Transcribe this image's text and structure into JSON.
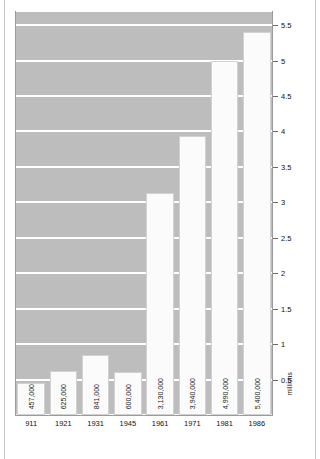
{
  "chart_data": {
    "type": "bar",
    "title": "",
    "subtitle": "",
    "xlabel": "",
    "ylabel": "millions",
    "categories": [
      "911",
      "1921",
      "1931",
      "1945",
      "1961",
      "1971",
      "1981",
      "1986"
    ],
    "values": [
      0.457,
      0.625,
      0.841,
      0.6,
      3.13,
      3.94,
      4.99,
      5.4
    ],
    "data_labels": [
      "457,000",
      "625,000",
      "841,000",
      "600,000",
      "3,130,000",
      "3,940,000",
      "4,990,000",
      "5,400,000"
    ],
    "ylim": [
      0,
      5.7
    ],
    "yticks": [
      0.5,
      1,
      1.5,
      2,
      2.5,
      3,
      3.5,
      4,
      4.5,
      5,
      5.5
    ],
    "ytick_labels": [
      "0.5",
      "1",
      "1.5",
      "2",
      "2.5",
      "3",
      "3.5",
      "4",
      "4.5",
      "5",
      "5.5"
    ],
    "grid": true,
    "grid_style": "banded",
    "legend": "none",
    "axis_position": "right",
    "colors": {
      "band": "#bdbdbd",
      "bar_fill": "#fbfbfb",
      "bar_border": "#d2d2d2",
      "axis": "#9a9a9a",
      "text": "#111111",
      "background": "#ffffff"
    }
  }
}
